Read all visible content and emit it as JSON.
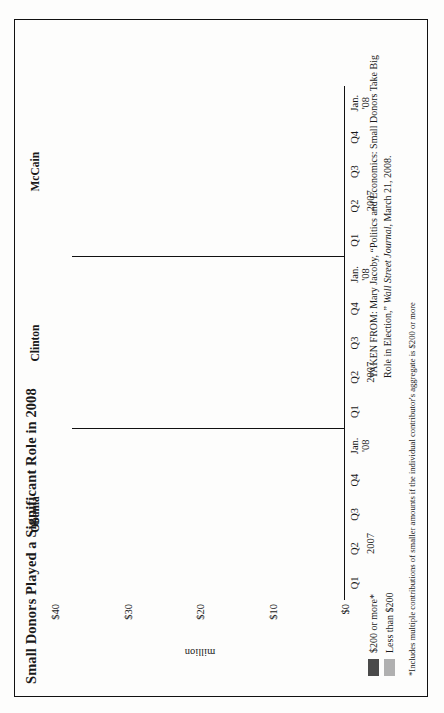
{
  "title": "Small Donors Played a Significant Role in 2008",
  "axis": {
    "value_title": "million",
    "ticks": [
      "$40",
      "$30",
      "$20",
      "$10",
      "$0"
    ]
  },
  "legend": [
    {
      "label": "$200 or more*",
      "color": "#4a4a4a",
      "key": "large"
    },
    {
      "label": "Less than $200",
      "color": "#b0b0b0",
      "key": "small"
    }
  ],
  "footnote": "*Includes multiple contributions of smaller amounts if the individual contributor's aggregate is $200 or more",
  "source": {
    "prefix": "TAKEN FROM: Mary Jacoby, “Politics and Economics: Small Donors Take Big Role in Election,” ",
    "publication": "Wall Street Journal",
    "suffix": ", March 21, 2008."
  },
  "period_label_year": "2007",
  "panels": [
    {
      "name": "Obama"
    },
    {
      "name": "Clinton"
    },
    {
      "name": "McCain"
    }
  ],
  "categories": [
    "Q1",
    "Q2",
    "Q3",
    "Q4",
    "Jan. '08"
  ],
  "chart_data": {
    "type": "bar",
    "subtype": "stacked-horizontal-grouped",
    "title": "Small Donors Played a Significant Role in 2008",
    "xlabel": "",
    "ylabel": "million",
    "ylim": [
      0,
      40
    ],
    "yticks": [
      0,
      10,
      20,
      30,
      40
    ],
    "ytick_labels": [
      "$0",
      "$10",
      "$20",
      "$30",
      "$40"
    ],
    "grid": false,
    "legend_position": "below-left",
    "units": "USD millions",
    "categories": [
      "Q1",
      "Q2",
      "Q3",
      "Q4",
      "Jan. '08"
    ],
    "period_note": "Q1-Q4 are 2007; final category is January 2008",
    "panels": [
      {
        "name": "Obama",
        "series": [
          {
            "name": "$200 or more*",
            "color": "#4a4a4a",
            "values": [
              14,
              20,
              11,
              12,
              21
            ]
          },
          {
            "name": "Less than $200",
            "color": "#b0b0b0",
            "values": [
              11,
              11,
              8,
              9,
              11
            ]
          }
        ],
        "totals": [
          25,
          31,
          19,
          21,
          32
        ]
      },
      {
        "name": "Clinton",
        "series": [
          {
            "name": "$200 or more*",
            "color": "#4a4a4a",
            "values": [
              19,
              20,
              19,
              19,
              9
            ]
          },
          {
            "name": "Less than $200",
            "color": "#b0b0b0",
            "values": [
              4,
              4,
              4,
              4,
              4
            ]
          }
        ],
        "totals": [
          23,
          24,
          23,
          23,
          13
        ]
      },
      {
        "name": "McCain",
        "series": [
          {
            "name": "$200 or more*",
            "color": "#4a4a4a",
            "values": [
              12,
              10,
              4,
              6,
              9
            ]
          },
          {
            "name": "Less than $200",
            "color": "#b0b0b0",
            "values": [
              2,
              2,
              2,
              2,
              2
            ]
          }
        ],
        "totals": [
          14,
          12,
          6,
          8,
          11
        ]
      }
    ]
  }
}
